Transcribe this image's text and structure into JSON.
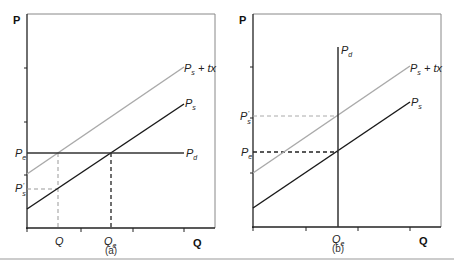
{
  "figure": {
    "rule_color": "#999999",
    "colors": {
      "supply": "#1a1a1a",
      "supply_tax": "#aaaaaa",
      "demand": "#333333",
      "frame": "#888888"
    }
  },
  "panels": [
    {
      "id": "a",
      "caption": "(a)",
      "y_axis_label": "P",
      "x_axis_label": "Q",
      "curves": {
        "supply_tax": {
          "label": "P",
          "sub": "s",
          "suffix": " + tx"
        },
        "supply": {
          "label": "P",
          "sub": "s"
        },
        "demand": {
          "label": "P",
          "sub": "d",
          "orientation": "horizontal"
        }
      },
      "y_ticks": [
        {
          "label": "P",
          "sub": "e"
        },
        {
          "label": "P",
          "sub": "s",
          "prime": "'"
        }
      ],
      "x_ticks": [
        {
          "label": "Q",
          "sub": ""
        },
        {
          "label": "Q",
          "sub": "e"
        }
      ]
    },
    {
      "id": "b",
      "caption": "(b)",
      "y_axis_label": "P",
      "x_axis_label": "Q",
      "curves": {
        "supply_tax": {
          "label": "P",
          "sub": "s",
          "suffix": " + tx"
        },
        "supply": {
          "label": "P",
          "sub": "s"
        },
        "demand": {
          "label": "P",
          "sub": "d",
          "orientation": "vertical"
        }
      },
      "y_ticks": [
        {
          "label": "P",
          "sub": "s",
          "prime": "'"
        },
        {
          "label": "P",
          "sub": "e"
        }
      ],
      "x_ticks": [
        {
          "label": "Q",
          "sub": "e"
        }
      ]
    }
  ]
}
